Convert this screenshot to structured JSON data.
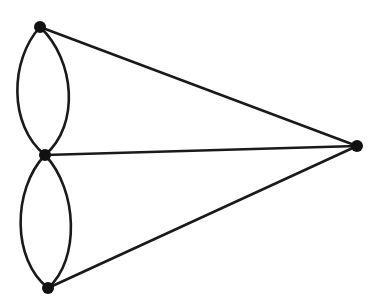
{
  "diagram": {
    "type": "graph",
    "colors": {
      "stroke": "#1a1a1a",
      "vertex": "#111111",
      "background": "#ffffff"
    },
    "vertices": [
      {
        "id": "top",
        "x": 40,
        "y": 27
      },
      {
        "id": "middle",
        "x": 45,
        "y": 155
      },
      {
        "id": "bottom",
        "x": 48,
        "y": 288
      },
      {
        "id": "right",
        "x": 357,
        "y": 146
      }
    ],
    "edges": [
      {
        "from": "top",
        "to": "middle",
        "kind": "curve-left"
      },
      {
        "from": "top",
        "to": "middle",
        "kind": "curve-right"
      },
      {
        "from": "middle",
        "to": "bottom",
        "kind": "curve-left"
      },
      {
        "from": "middle",
        "to": "bottom",
        "kind": "curve-right"
      },
      {
        "from": "top",
        "to": "right",
        "kind": "straight"
      },
      {
        "from": "middle",
        "to": "right",
        "kind": "straight"
      },
      {
        "from": "bottom",
        "to": "right",
        "kind": "straight"
      }
    ]
  }
}
